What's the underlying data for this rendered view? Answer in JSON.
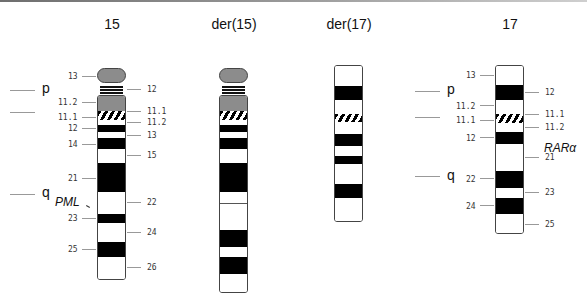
{
  "figure": {
    "chromosomes": [
      {
        "id": "chr15",
        "title": "15",
        "title_x": 112
      },
      {
        "id": "der15",
        "title": "der(15)",
        "title_x": 234
      },
      {
        "id": "der17",
        "title": "der(17)",
        "title_x": 349
      },
      {
        "id": "chr17",
        "title": "17",
        "title_x": 510
      }
    ],
    "arm_labels": {
      "left_p": "p",
      "left_q": "q",
      "right_p": "p",
      "right_q": "q"
    },
    "chr15_left_bands": [
      "13",
      "11.2",
      "11.1",
      "12",
      "14",
      "21",
      "23",
      "25"
    ],
    "chr15_right_bands": [
      "12",
      "11.1",
      "11.2",
      "13",
      "15",
      "22",
      "24",
      "26"
    ],
    "chr17_left_bands": [
      "13",
      "11.2",
      "11.1",
      "12",
      "22",
      "24"
    ],
    "chr17_right_bands": [
      "12",
      "11.1",
      "11.2",
      "21",
      "23",
      "25"
    ],
    "genes": {
      "pml": "PML",
      "rara": "RARα"
    },
    "colors": {
      "dark_band": "#000000",
      "light_band": "#ffffff",
      "satellite_gray": "#8c8c8c",
      "tick_gray": "#999999"
    }
  }
}
